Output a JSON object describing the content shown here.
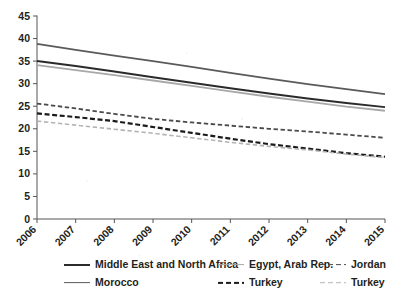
{
  "chart_data": {
    "type": "line",
    "title": "",
    "subtitle": "",
    "xlabel": "",
    "ylabel": "",
    "x": [
      "2006",
      "2007",
      "2008",
      "2009",
      "2010",
      "2011",
      "2012",
      "2013",
      "2014",
      "2015"
    ],
    "categories": [
      "2006",
      "2007",
      "2008",
      "2009",
      "2010",
      "2011",
      "2012",
      "2013",
      "2014",
      "2015"
    ],
    "xlim": [
      2006,
      2015
    ],
    "ylim": [
      0,
      45
    ],
    "ytick_labels": [
      "0",
      "5",
      "10",
      "15",
      "20",
      "25",
      "30",
      "35",
      "40",
      "45"
    ],
    "ytick_values": [
      0,
      5,
      10,
      15,
      20,
      25,
      30,
      35,
      40,
      45
    ],
    "xtick_labels": [
      "2006",
      "2007",
      "2008",
      "2009",
      "2010",
      "2011",
      "2012",
      "2013",
      "2014",
      "2015"
    ],
    "grid": false,
    "legend_position": "bottom",
    "series": [
      {
        "name": "Middle East and North Africa",
        "style": "solid",
        "color": "#2b2b2b",
        "width": 2.0,
        "values": [
          35.0,
          33.9,
          32.7,
          31.4,
          30.2,
          29.0,
          27.8,
          26.7,
          25.7,
          24.8
        ]
      },
      {
        "name": "Morocco",
        "style": "solid",
        "color": "#5a5a5a",
        "width": 1.8,
        "values": [
          38.8,
          37.5,
          36.2,
          35.0,
          33.7,
          32.4,
          31.1,
          29.9,
          28.8,
          27.7
        ]
      },
      {
        "name": "Egypt, Arab Rep.",
        "style": "solid",
        "color": "#a8a8a8",
        "width": 1.8,
        "values": [
          34.1,
          33.0,
          31.9,
          30.7,
          29.5,
          28.3,
          27.1,
          26.0,
          24.9,
          24.0
        ]
      },
      {
        "name": "Turkey",
        "style": "dashed",
        "color": "#1a1a1a",
        "width": 2.2,
        "values": [
          23.4,
          22.6,
          21.7,
          20.4,
          19.1,
          17.8,
          16.6,
          15.6,
          14.6,
          13.8
        ]
      },
      {
        "name": "Jordan",
        "style": "dashed",
        "color": "#4a4a4a",
        "width": 1.8,
        "values": [
          25.6,
          24.5,
          23.3,
          22.2,
          21.4,
          20.7,
          20.0,
          19.4,
          18.7,
          18.0
        ]
      },
      {
        "name": "Turkey",
        "style": "dashed",
        "color": "#b4b4b4",
        "width": 1.6,
        "values": [
          21.7,
          20.8,
          19.9,
          19.0,
          18.0,
          17.0,
          16.1,
          15.3,
          14.4,
          13.6
        ]
      }
    ]
  },
  "legend": {
    "rows": [
      [
        {
          "label": "Middle East and North Africa",
          "style": "solid",
          "color": "#2b2b2b",
          "width": 2.0,
          "left": 64
        },
        {
          "label": "Egypt, Arab Rep.",
          "style": "solid",
          "color": "#a8a8a8",
          "width": 1.8,
          "left": 218
        },
        {
          "label": "Jordan",
          "style": "dashed",
          "color": "#4a4a4a",
          "width": 1.8,
          "left": 320
        }
      ],
      [
        {
          "label": "Morocco",
          "style": "solid",
          "color": "#5a5a5a",
          "width": 1.8,
          "left": 64
        },
        {
          "label": "Turkey",
          "style": "dashed",
          "color": "#1a1a1a",
          "width": 2.2,
          "left": 218
        },
        {
          "label": "Turkey",
          "style": "dashed",
          "color": "#b4b4b4",
          "width": 1.6,
          "left": 320
        }
      ]
    ]
  },
  "axes": {
    "axis_color": "#555555",
    "tick_color": "#555555"
  }
}
